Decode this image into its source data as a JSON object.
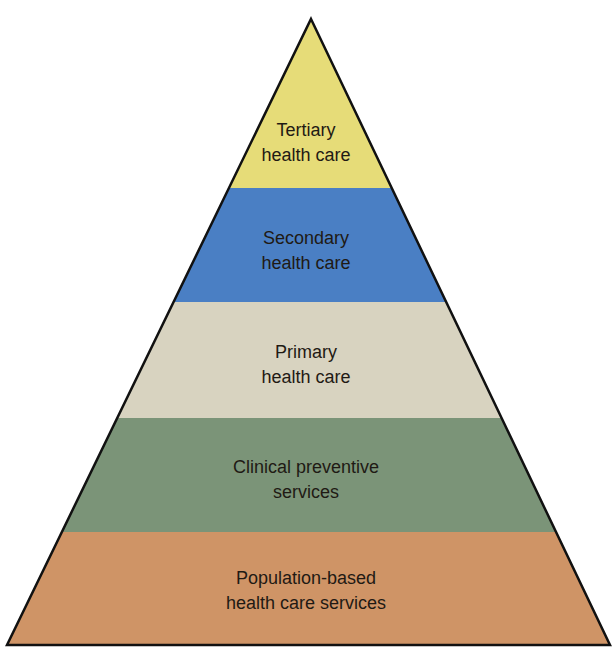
{
  "diagram": {
    "type": "pyramid",
    "levels": [
      {
        "id": "tertiary",
        "line1": "Tertiary",
        "line2": "health care",
        "color": "#e6dc78",
        "top": 19,
        "bottom": 188
      },
      {
        "id": "secondary",
        "line1": "Secondary",
        "line2": "health care",
        "color": "#4a7fc4",
        "top": 188,
        "bottom": 302
      },
      {
        "id": "primary",
        "line1": "Primary",
        "line2": "health care",
        "color": "#d8d3c0",
        "top": 302,
        "bottom": 418
      },
      {
        "id": "clinical-preventive",
        "line1": "Clinical preventive",
        "line2": "services",
        "color": "#7b9478",
        "top": 418,
        "bottom": 532
      },
      {
        "id": "population-based",
        "line1": "Population-based",
        "line2": "health care services",
        "color": "#cf9466",
        "top": 532,
        "bottom": 645
      }
    ],
    "outline_color": "#111111"
  }
}
